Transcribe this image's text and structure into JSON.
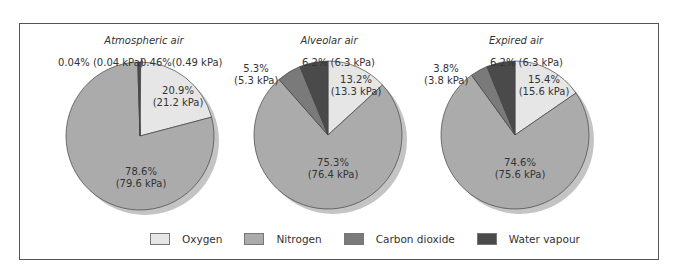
{
  "colors": {
    "oxygen": "#e6e6e6",
    "nitrogen": "#ababab",
    "carbon_dioxide": "#7a7a7a",
    "water_vapour": "#4a4a4a",
    "shadow": "#c4c4c4",
    "frame": "#555555"
  },
  "legend": {
    "oxygen": "Oxygen",
    "nitrogen": "Nitrogen",
    "carbon_dioxide": "Carbon dioxide",
    "water_vapour": "Water vapour"
  },
  "pies": [
    {
      "title": "Atmospheric air",
      "labels": {
        "oxygen_pct": "20.9%",
        "oxygen_kpa": "(21.2 kPa)",
        "nitrogen_pct": "78.6%",
        "nitrogen_kpa": "(79.6 kPa)",
        "co2": "0.04% (0.04 kPa)",
        "water": "0.46%(0.49 kPa)"
      }
    },
    {
      "title": "Alveolar air",
      "labels": {
        "oxygen_pct": "13.2%",
        "oxygen_kpa": "(13.3 kPa)",
        "nitrogen_pct": "75.3%",
        "nitrogen_kpa": "(76.4 kPa)",
        "co2_pct": "5.3%",
        "co2_kpa": "(5.3 kPa)",
        "water": "6.2% (6.3 kPa)"
      }
    },
    {
      "title": "Expired air",
      "labels": {
        "oxygen_pct": "15.4%",
        "oxygen_kpa": "(15.6 kPa)",
        "nitrogen_pct": "74.6%",
        "nitrogen_kpa": "(75.6 kPa)",
        "co2_pct": "3.8%",
        "co2_kpa": "(3.8 kPa)",
        "water": "6.2% (6.3 kPa)"
      }
    }
  ],
  "chart_data": [
    {
      "type": "pie",
      "title": "Atmospheric air",
      "categories": [
        "Oxygen",
        "Nitrogen",
        "Carbon dioxide",
        "Water vapour"
      ],
      "values": [
        20.9,
        78.6,
        0.04,
        0.46
      ],
      "partial_pressures_kpa": [
        21.2,
        79.6,
        0.04,
        0.49
      ],
      "unit": "%",
      "legend_position": "bottom"
    },
    {
      "type": "pie",
      "title": "Alveolar air",
      "categories": [
        "Oxygen",
        "Nitrogen",
        "Carbon dioxide",
        "Water vapour"
      ],
      "values": [
        13.2,
        75.3,
        5.3,
        6.2
      ],
      "partial_pressures_kpa": [
        13.3,
        76.4,
        5.3,
        6.3
      ],
      "unit": "%",
      "legend_position": "bottom"
    },
    {
      "type": "pie",
      "title": "Expired air",
      "categories": [
        "Oxygen",
        "Nitrogen",
        "Carbon dioxide",
        "Water vapour"
      ],
      "values": [
        15.4,
        74.6,
        3.8,
        6.2
      ],
      "partial_pressures_kpa": [
        15.6,
        75.6,
        3.8,
        6.3
      ],
      "unit": "%",
      "legend_position": "bottom"
    }
  ]
}
